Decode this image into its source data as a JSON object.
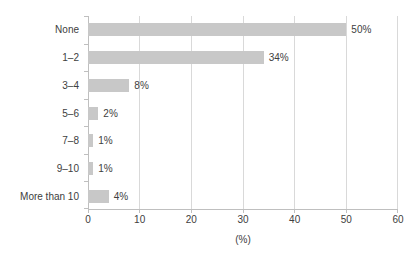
{
  "colors": {
    "bar_fill": "#c8c8c8",
    "gridline": "#d9d9d9",
    "axis_line": "#bfbfbf",
    "text": "#404040",
    "background": "#ffffff"
  },
  "chart_data": {
    "type": "bar",
    "orientation": "horizontal",
    "title": "",
    "categories": [
      "None",
      "1–2",
      "3–4",
      "5–6",
      "7–8",
      "9–10",
      "More than 10"
    ],
    "values": [
      50,
      34,
      8,
      2,
      1,
      1,
      4
    ],
    "data_labels": [
      "50%",
      "34%",
      "8%",
      "2%",
      "1%",
      "1%",
      "4%"
    ],
    "xlabel": "(%)",
    "ylabel": "",
    "xlim": [
      0,
      60
    ],
    "xticks": [
      0,
      10,
      20,
      30,
      40,
      50,
      60
    ],
    "xtick_labels": [
      "0",
      "10",
      "20",
      "30",
      "40",
      "50",
      "60"
    ],
    "grid": true,
    "legend": "none"
  }
}
